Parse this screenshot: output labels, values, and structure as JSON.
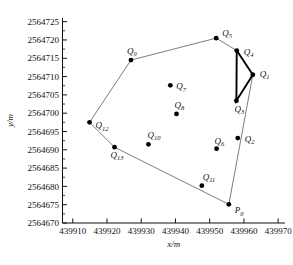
{
  "chart_data": {
    "type": "scatter",
    "title": "",
    "xlabel": "x/m",
    "ylabel": "y/m",
    "xlim": [
      439907,
      439972
    ],
    "ylim": [
      2564670,
      2564726
    ],
    "xticks": [
      "439910",
      "439920",
      "439930",
      "439940",
      "439950",
      "439960",
      "439970"
    ],
    "xtick_values": [
      439910,
      439920,
      439930,
      439940,
      439950,
      439960,
      439970
    ],
    "yticks": [
      "2564670",
      "2564675",
      "2564680",
      "2564685",
      "2564690",
      "2564695",
      "2564700",
      "2564705",
      "2564710",
      "2564715",
      "2564720",
      "2564725"
    ],
    "ytick_values": [
      2564670,
      2564675,
      2564680,
      2564685,
      2564690,
      2564695,
      2564700,
      2564705,
      2564710,
      2564715,
      2564720,
      2564725
    ],
    "grid": false,
    "legend": "none",
    "points": [
      {
        "id": "P0",
        "label": "P",
        "sub": "0",
        "x": 439955.6,
        "y": 2564675.1,
        "label_dx": 6,
        "label_dy": 9
      },
      {
        "id": "Q1",
        "label": "Q",
        "sub": "1",
        "x": 439962.6,
        "y": 2564710.5,
        "label_dx": 7,
        "label_dy": 2
      },
      {
        "id": "Q2",
        "label": "Q",
        "sub": "2",
        "x": 439958.2,
        "y": 2564693.2,
        "label_dx": 7,
        "label_dy": 4
      },
      {
        "id": "Q3",
        "label": "Q",
        "sub": "3",
        "x": 439957.8,
        "y": 2564703.4,
        "label_dx": -2,
        "label_dy": 11
      },
      {
        "id": "Q4",
        "label": "Q",
        "sub": "4",
        "x": 439957.9,
        "y": 2564717.1,
        "label_dx": 7,
        "label_dy": 4
      },
      {
        "id": "Q5",
        "label": "Q",
        "sub": "5",
        "x": 439951.9,
        "y": 2564720.5,
        "label_dx": 6,
        "label_dy": -2
      },
      {
        "id": "Q6",
        "label": "Q",
        "sub": "6",
        "x": 439952.0,
        "y": 2564690.3,
        "label_dx": -2,
        "label_dy": -5
      },
      {
        "id": "Q7",
        "label": "Q",
        "sub": "7",
        "x": 439938.5,
        "y": 2564707.6,
        "label_dx": 6,
        "label_dy": 4
      },
      {
        "id": "Q8",
        "label": "Q",
        "sub": "8",
        "x": 439940.3,
        "y": 2564699.8,
        "label_dx": -2,
        "label_dy": -6
      },
      {
        "id": "Q9",
        "label": "Q",
        "sub": "9",
        "x": 439927.0,
        "y": 2564714.5,
        "label_dx": -4,
        "label_dy": -6
      },
      {
        "id": "Q10",
        "label": "Q",
        "sub": "10",
        "x": 439932.1,
        "y": 2564691.5,
        "label_dx": -1,
        "label_dy": -6
      },
      {
        "id": "Q11",
        "label": "Q",
        "sub": "11",
        "x": 439947.7,
        "y": 2564680.2,
        "label_dx": 1,
        "label_dy": -6
      },
      {
        "id": "Q12",
        "label": "Q",
        "sub": "12",
        "x": 439914.9,
        "y": 2564697.5,
        "label_dx": 6,
        "label_dy": 6
      },
      {
        "id": "Q13",
        "label": "Q",
        "sub": "13",
        "x": 439922.2,
        "y": 2564690.7,
        "label_dx": -4,
        "label_dy": 11
      }
    ],
    "boundary_path": [
      "P0",
      "Q1",
      "Q4",
      "Q5",
      "Q9",
      "Q12",
      "Q13",
      "P0"
    ],
    "triangle_path": [
      "Q4",
      "Q3",
      "Q1",
      "Q4"
    ],
    "colors": {
      "point": "#000000",
      "boundary": "#6e6e6e",
      "triangle": "#000000",
      "axis": "#111111",
      "background": "#ffffff"
    }
  }
}
